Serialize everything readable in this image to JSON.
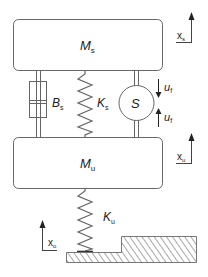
{
  "diagram": {
    "type": "quarter-car suspension model",
    "colors": {
      "line": "#555555",
      "text": "#222222",
      "hatch": "#9a9a9a",
      "background": "#ffffff"
    },
    "sprung_mass": {
      "symbol": "M",
      "sub": "s"
    },
    "unsprung_mass": {
      "symbol": "M",
      "sub": "u"
    },
    "damper": {
      "symbol": "B",
      "sub": "s"
    },
    "suspension_spring": {
      "symbol": "K",
      "sub": "s"
    },
    "actuator": {
      "symbol": "S"
    },
    "actuator_force_top": {
      "symbol": "u",
      "sub": "f"
    },
    "actuator_force_bottom": {
      "symbol": "u",
      "sub": "f"
    },
    "tire_spring": {
      "symbol": "K",
      "sub": "u"
    },
    "displacement_sprung": {
      "symbol": "x",
      "sub": "s"
    },
    "displacement_unsprung": {
      "symbol": "x",
      "sub": "u"
    },
    "displacement_road": {
      "symbol": "x",
      "sub": "o"
    }
  }
}
